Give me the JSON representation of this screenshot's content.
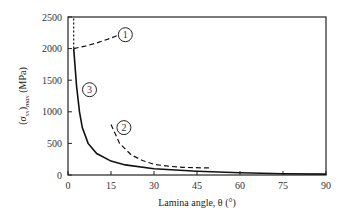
{
  "chart_data": {
    "type": "line",
    "title": "",
    "xlabel": "Lamina angle, θ (°)",
    "ylabel": "(σxx)max (MPa)",
    "xlim": [
      0,
      90
    ],
    "ylim": [
      0,
      2500
    ],
    "xticks": [
      "0",
      "15",
      "30",
      "45",
      "60",
      "75",
      "90"
    ],
    "yticks": [
      "0",
      "500",
      "1000",
      "1500",
      "2000",
      "2500"
    ],
    "grid": false,
    "series": [
      {
        "name": "1",
        "style": "dashed",
        "x": [
          2,
          6,
          10,
          14,
          18
        ],
        "y": [
          2000,
          2040,
          2090,
          2150,
          2220
        ]
      },
      {
        "name": "2",
        "style": "dashed",
        "x": [
          15,
          18,
          22,
          26,
          30,
          35,
          40,
          50
        ],
        "y": [
          800,
          500,
          320,
          230,
          170,
          140,
          120,
          110
        ]
      },
      {
        "name": "3",
        "style": "solid",
        "x": [
          2,
          3,
          4,
          5,
          7,
          10,
          15,
          20,
          30,
          45,
          60,
          75,
          90
        ],
        "y": [
          2000,
          1400,
          1000,
          750,
          500,
          340,
          220,
          160,
          100,
          60,
          35,
          20,
          15
        ]
      },
      {
        "name": "limit",
        "style": "dotted",
        "x": [
          2,
          2
        ],
        "y": [
          2000,
          2500
        ]
      }
    ],
    "annotations": [
      "1",
      "2",
      "3"
    ]
  }
}
